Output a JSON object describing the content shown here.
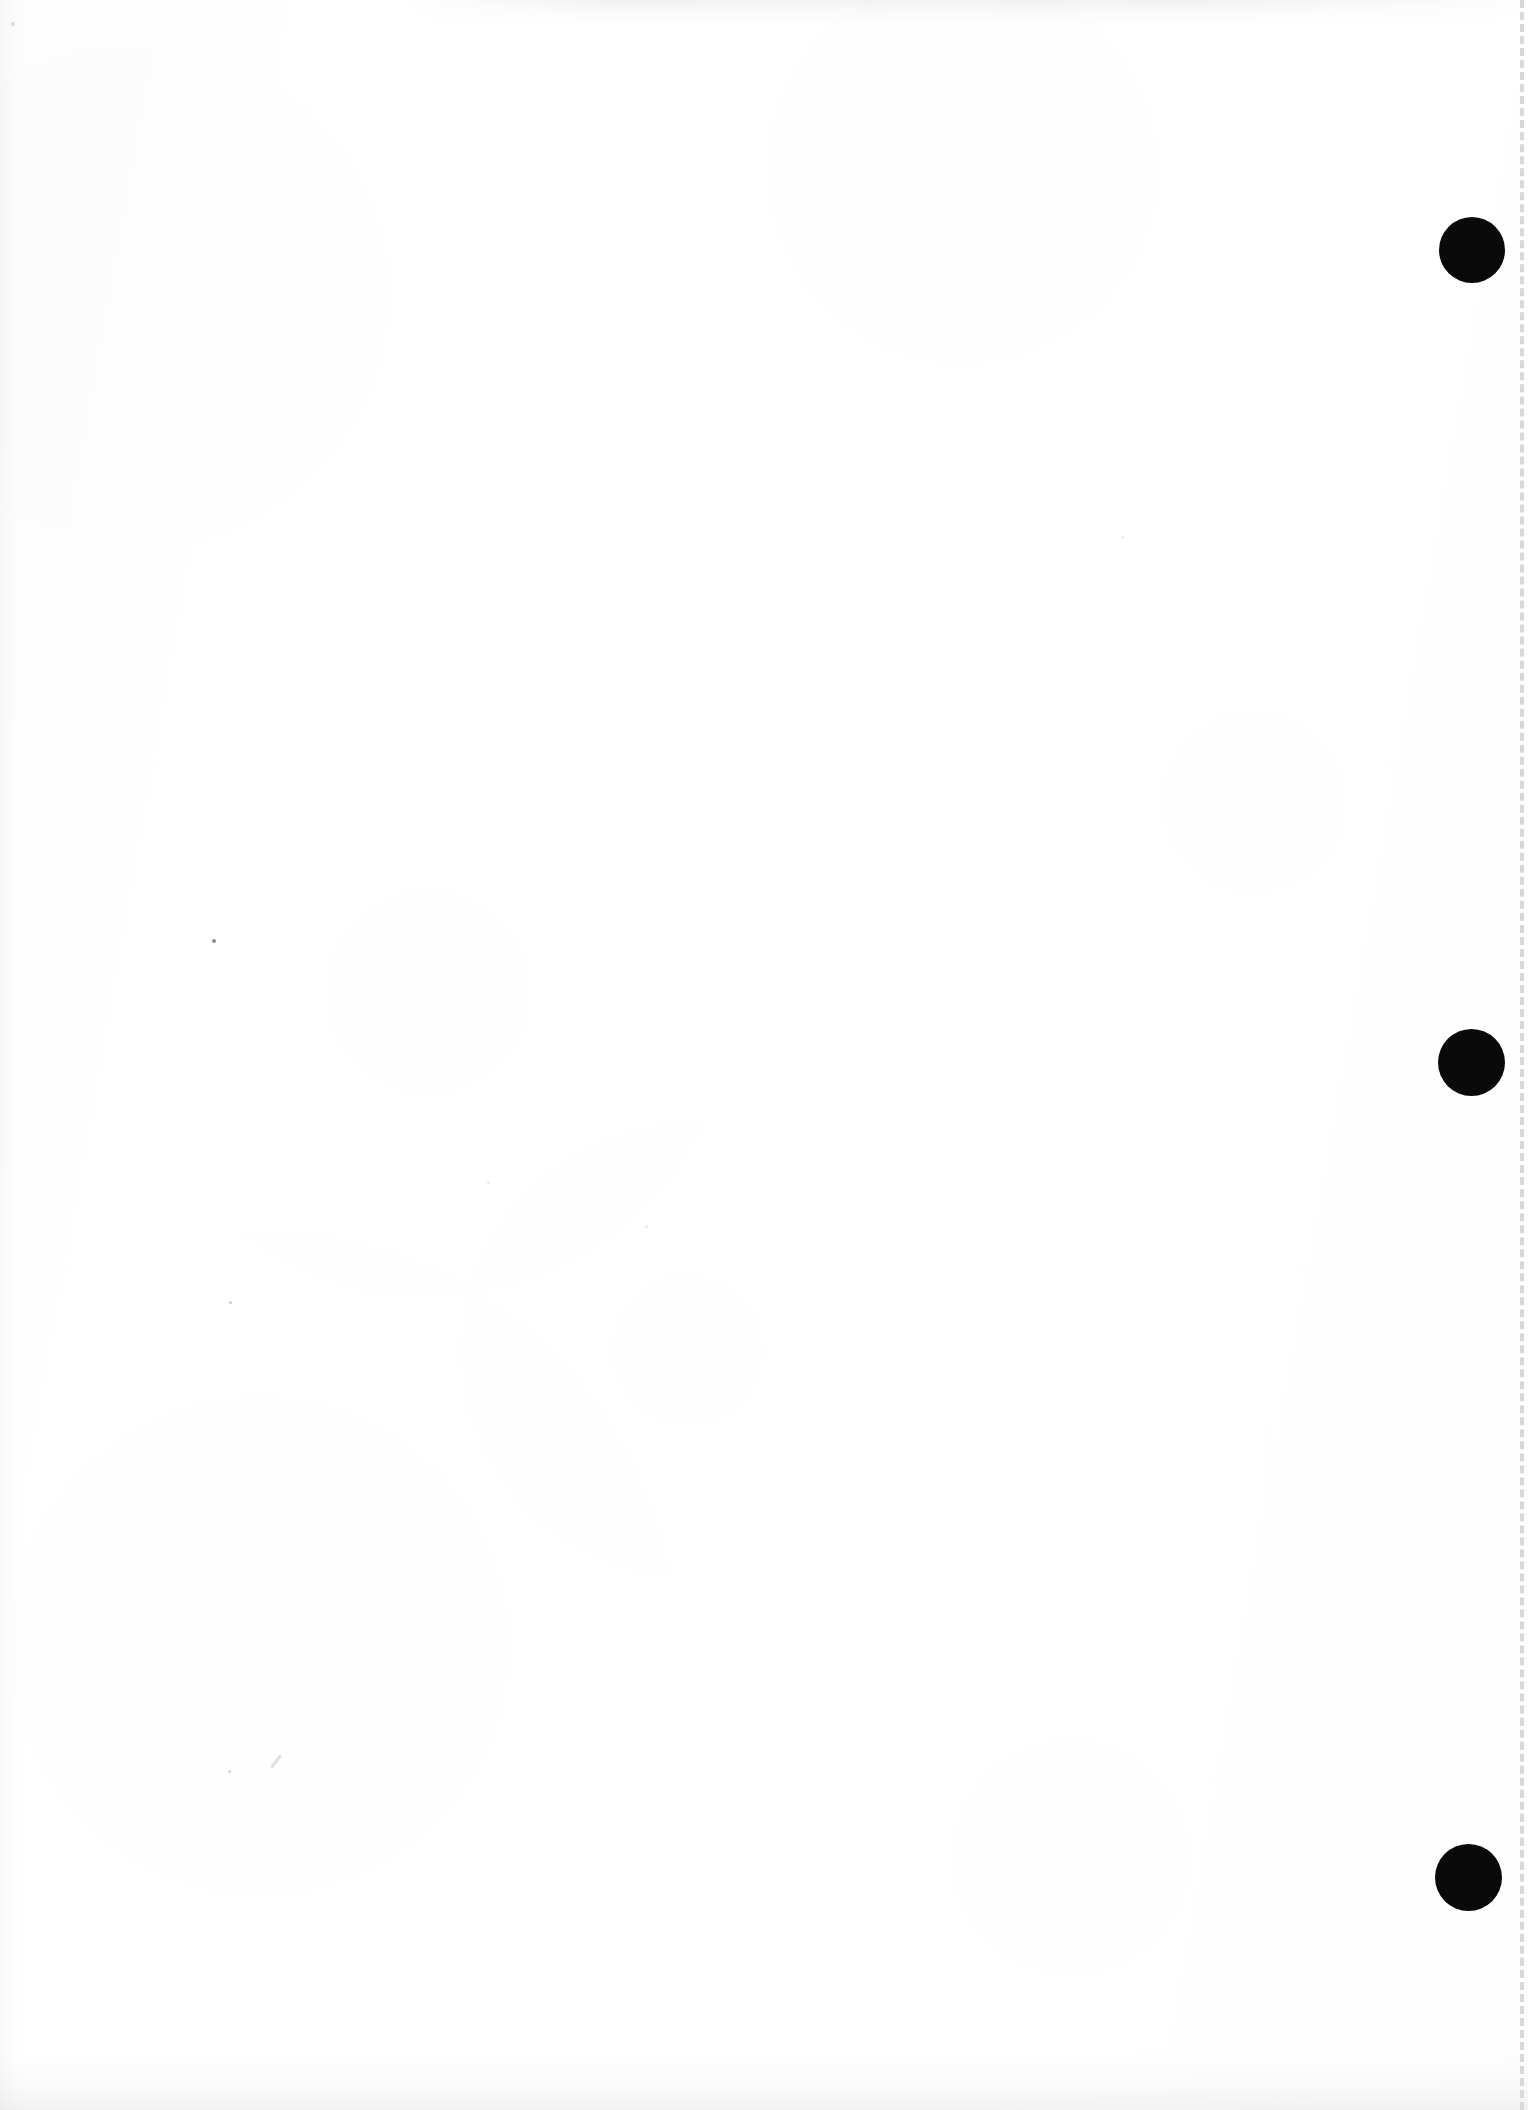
{
  "page": {
    "kind": "scanned-blank-page",
    "width": 1528,
    "height": 2110,
    "background_color": "#ffffff",
    "paper_tone_color": "#fdfdfd",
    "visible_text": "",
    "note_label": ""
  },
  "marks": {
    "registration_dots": {
      "name": "registration-dot",
      "color": "#0a0a0a",
      "count": 3,
      "diameter": 66,
      "items": [
        {
          "label": "top",
          "cx": 1472,
          "cy": 250,
          "d": 66
        },
        {
          "label": "middle",
          "cx": 1471,
          "cy": 1062,
          "d": 67
        },
        {
          "label": "bottom",
          "cx": 1468,
          "cy": 1877,
          "d": 67
        }
      ]
    },
    "dashed_rule": {
      "name": "dashed-guide-line",
      "color": "#d8d8d8",
      "x": 1520,
      "y_start": 0,
      "y_end": 2110,
      "thickness": 4,
      "dash_length": 20,
      "gap_length": 13
    },
    "specks": [
      {
        "x": 212,
        "y": 939,
        "size": 4,
        "color": "rgba(0,0,0,0.45)"
      },
      {
        "x": 229,
        "y": 1301,
        "size": 3,
        "color": "rgba(0,0,0,0.20)"
      },
      {
        "x": 228,
        "y": 1770,
        "size": 3,
        "color": "rgba(0,0,0,0.16)"
      },
      {
        "x": 645,
        "y": 1225,
        "size": 3,
        "color": "rgba(0,0,0,0.10)"
      },
      {
        "x": 487,
        "y": 1181,
        "size": 3,
        "color": "rgba(0,0,0,0.09)"
      },
      {
        "x": 1121,
        "y": 536,
        "size": 3,
        "color": "rgba(0,0,0,0.08)"
      },
      {
        "x": 11,
        "y": 22,
        "size": 4,
        "color": "rgba(0,0,0,0.12)"
      }
    ],
    "stray_stroke": {
      "name": "stray-pencil-mark",
      "x": 268,
      "y": 1760,
      "length": 16,
      "thickness": 3,
      "rotation_deg": -52,
      "color": "rgba(0,0,0,0.12)"
    }
  }
}
